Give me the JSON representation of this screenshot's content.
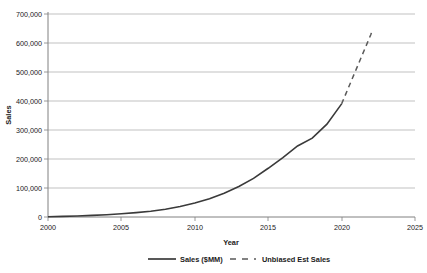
{
  "chart_data": {
    "type": "line",
    "title": "",
    "xlabel": "Year",
    "ylabel": "Sales",
    "xlim": [
      2000,
      2025
    ],
    "ylim": [
      0,
      700000
    ],
    "grid": true,
    "legend_position": "bottom",
    "xticks": [
      "2000",
      "2005",
      "2010",
      "2015",
      "2020",
      "2025"
    ],
    "xtick_values": [
      2000,
      2005,
      2010,
      2015,
      2020,
      2025
    ],
    "yticks": [
      "0",
      "100,000",
      "200,000",
      "300,000",
      "400,000",
      "500,000",
      "600,000",
      "700,000"
    ],
    "ytick_values": [
      0,
      100000,
      200000,
      300000,
      400000,
      500000,
      600000,
      700000
    ],
    "series": [
      {
        "name": "Sales ($MM)",
        "style": "solid",
        "color": "#3a3a3a",
        "x": [
          2000,
          2001,
          2002,
          2003,
          2004,
          2005,
          2006,
          2007,
          2008,
          2009,
          2010,
          2011,
          2012,
          2013,
          2014,
          2015,
          2016,
          2017,
          2018,
          2019,
          2020
        ],
        "values": [
          1000,
          2000,
          3500,
          5500,
          8000,
          11000,
          15000,
          20000,
          27000,
          36000,
          48000,
          63000,
          82000,
          105000,
          133000,
          168000,
          205000,
          245000,
          272000,
          320000,
          390000
        ]
      },
      {
        "name": "Unbiased Est Sales",
        "style": "dashed",
        "color": "#5a5a5a",
        "x": [
          2020,
          2021,
          2022,
          2022.1
        ],
        "values": [
          390000,
          510000,
          630000,
          648000
        ]
      }
    ]
  },
  "legend": {
    "items": [
      {
        "label": "Sales ($MM)",
        "style": "solid"
      },
      {
        "label": "Unbiased Est Sales",
        "style": "dashed"
      }
    ]
  }
}
